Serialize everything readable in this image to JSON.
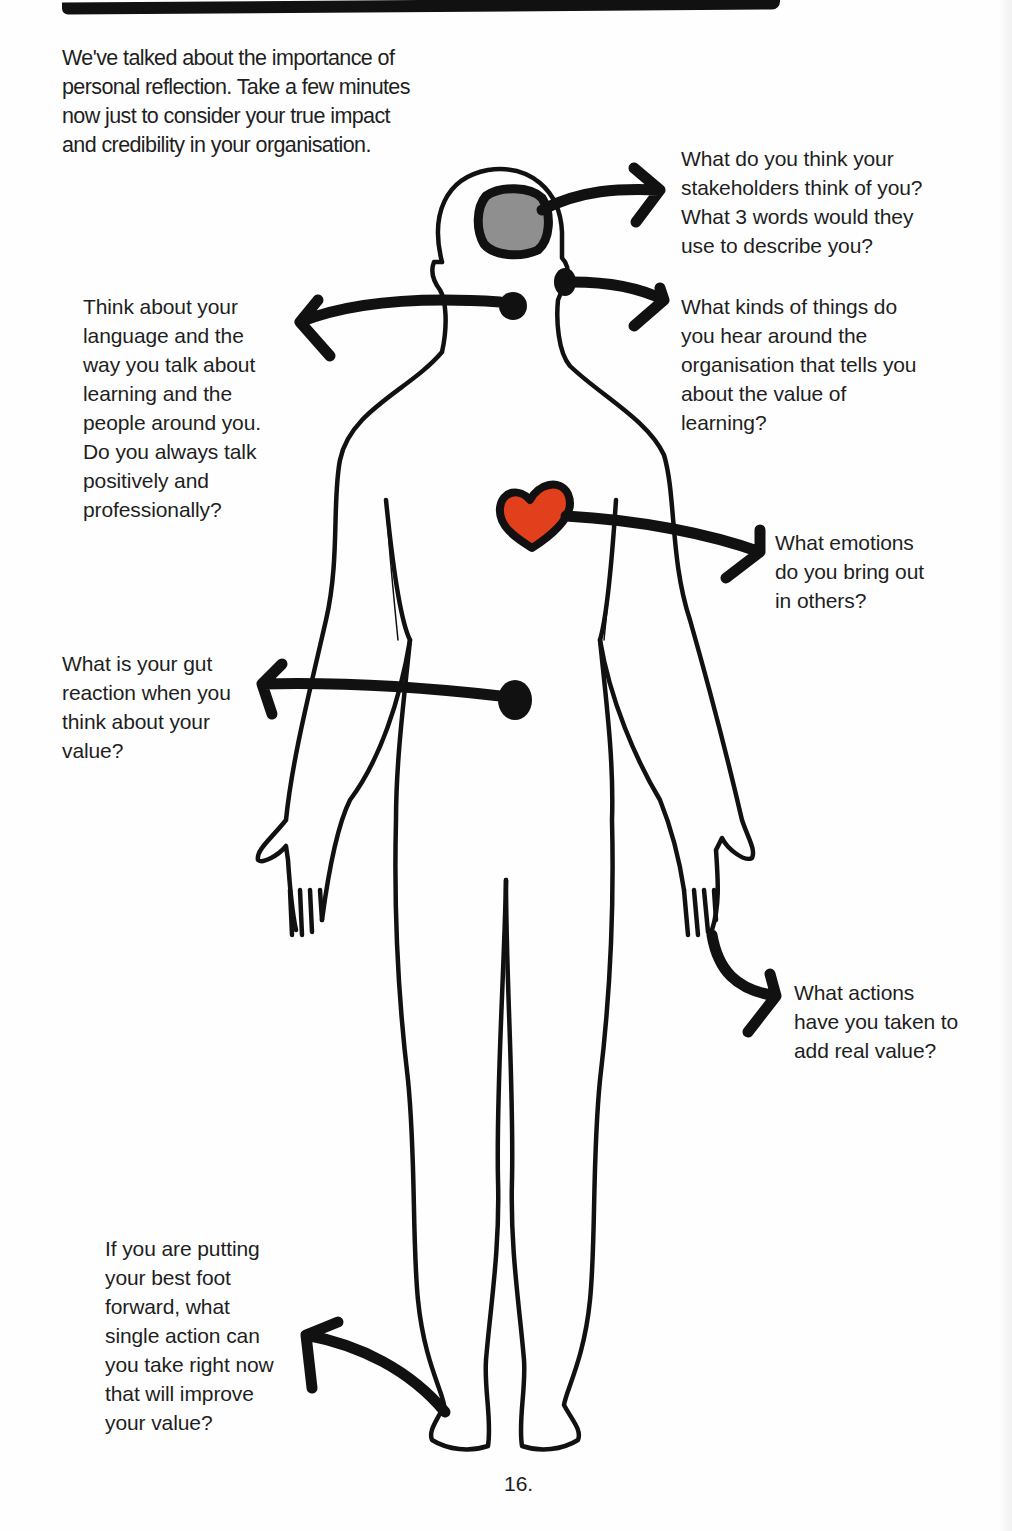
{
  "intro": {
    "lines": [
      "We've talked about the importance of",
      "personal reflection. Take a few minutes",
      "now just to consider your true impact",
      "and credibility in your organisation."
    ]
  },
  "callouts": {
    "head": {
      "target": "head",
      "lines": [
        "What do you think your",
        "stakeholders think of you?",
        "What 3 words would they",
        "use to describe you?"
      ]
    },
    "ear": {
      "target": "ear",
      "lines": [
        "What kinds of things do",
        "you hear around the",
        "organisation that tells you",
        "about the value of",
        "learning?"
      ]
    },
    "mouth": {
      "target": "mouth",
      "lines": [
        "Think about your",
        "language and the",
        "way you talk about",
        "learning and the",
        "people around you.",
        "Do you always talk",
        "positively and",
        "professionally?"
      ]
    },
    "heart": {
      "target": "heart",
      "lines": [
        "What emotions",
        "do you bring out",
        "in others?"
      ]
    },
    "gut": {
      "target": "gut",
      "lines": [
        "What is your gut",
        "reaction when you",
        "think about your",
        "value?"
      ]
    },
    "hand": {
      "target": "hand",
      "lines": [
        "What actions",
        "have you taken to",
        "add real value?"
      ]
    },
    "foot": {
      "target": "foot",
      "lines": [
        "If you are putting",
        "your best foot",
        "forward, what",
        "single action can",
        "you take right now",
        "that will improve",
        "your value?"
      ]
    }
  },
  "colors": {
    "ink": "#111111",
    "brain_fill": "#8f8f8f",
    "heart_fill": "#e2401c",
    "text": "#1e1e1e"
  },
  "footer": {
    "page_number": "16."
  }
}
